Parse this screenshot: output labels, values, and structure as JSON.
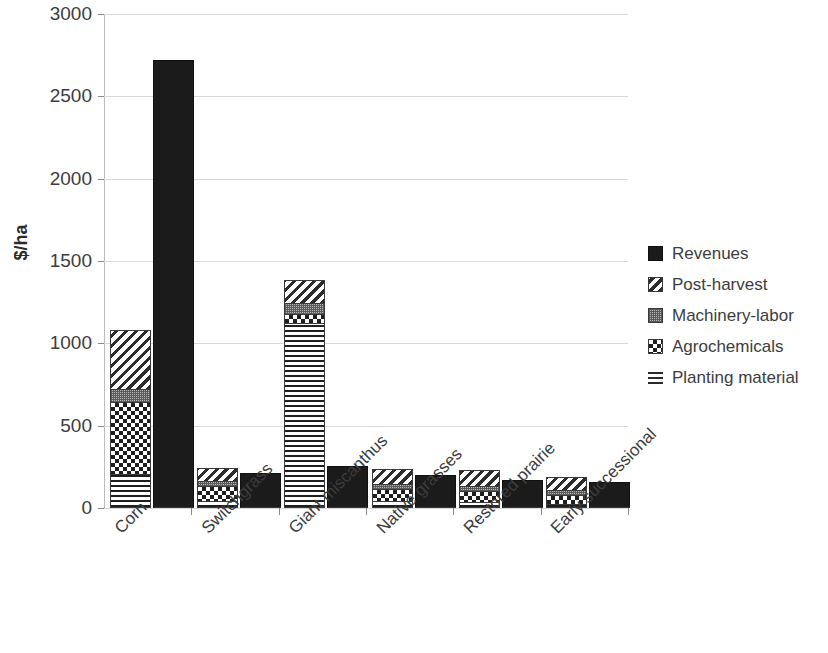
{
  "chart_data": {
    "type": "bar",
    "title": "",
    "subtitle": "",
    "xlabel": "",
    "ylabel": "$/ha",
    "ylim": [
      0,
      3000
    ],
    "yticks": [
      0,
      500,
      1000,
      1500,
      2000,
      2500,
      3000
    ],
    "grid": true,
    "legend_position": "right",
    "stacked": true,
    "categories": [
      "Corn",
      "Switchgrass",
      "Giant miscanthus",
      "Native grasses",
      "Restored prairie",
      "Early successional"
    ],
    "series": [
      {
        "name": "Revenues",
        "pattern": "solid-black",
        "color": "#1b1b1b",
        "stack": "revenue",
        "values": [
          2720,
          215,
          255,
          200,
          168,
          155
        ]
      },
      {
        "name": "Post-harvest",
        "pattern": "diagonal-hatch",
        "color": "#2c2c2c",
        "stack": "cost",
        "values": [
          360,
          80,
          140,
          95,
          95,
          80
        ]
      },
      {
        "name": "Machinery-labor",
        "pattern": "fine-grid",
        "color": "#b9b9b9",
        "stack": "cost",
        "values": [
          75,
          30,
          65,
          30,
          30,
          25
        ]
      },
      {
        "name": "Agrochemicals",
        "pattern": "checkerboard",
        "color": "#1f1f1f",
        "stack": "cost",
        "values": [
          440,
          95,
          55,
          75,
          70,
          60
        ]
      },
      {
        "name": "Planting material",
        "pattern": "horizontal-lines",
        "color": "#1f1f1f",
        "stack": "cost",
        "values": [
          205,
          40,
          1125,
          40,
          35,
          22
        ]
      }
    ],
    "cost_totals": [
      1080,
      245,
      1385,
      240,
      230,
      187
    ],
    "revenue_totals": [
      2720,
      215,
      255,
      200,
      168,
      155
    ]
  },
  "legend": {
    "items": [
      {
        "label": "Revenues",
        "icon": "solid-square-swatch"
      },
      {
        "label": "Post-harvest",
        "icon": "diagonal-hatch-swatch"
      },
      {
        "label": "Machinery-labor",
        "icon": "fine-grid-swatch"
      },
      {
        "label": "Agrochemicals",
        "icon": "checkerboard-swatch"
      },
      {
        "label": "Planting material",
        "icon": "horizontal-lines-swatch"
      }
    ]
  }
}
